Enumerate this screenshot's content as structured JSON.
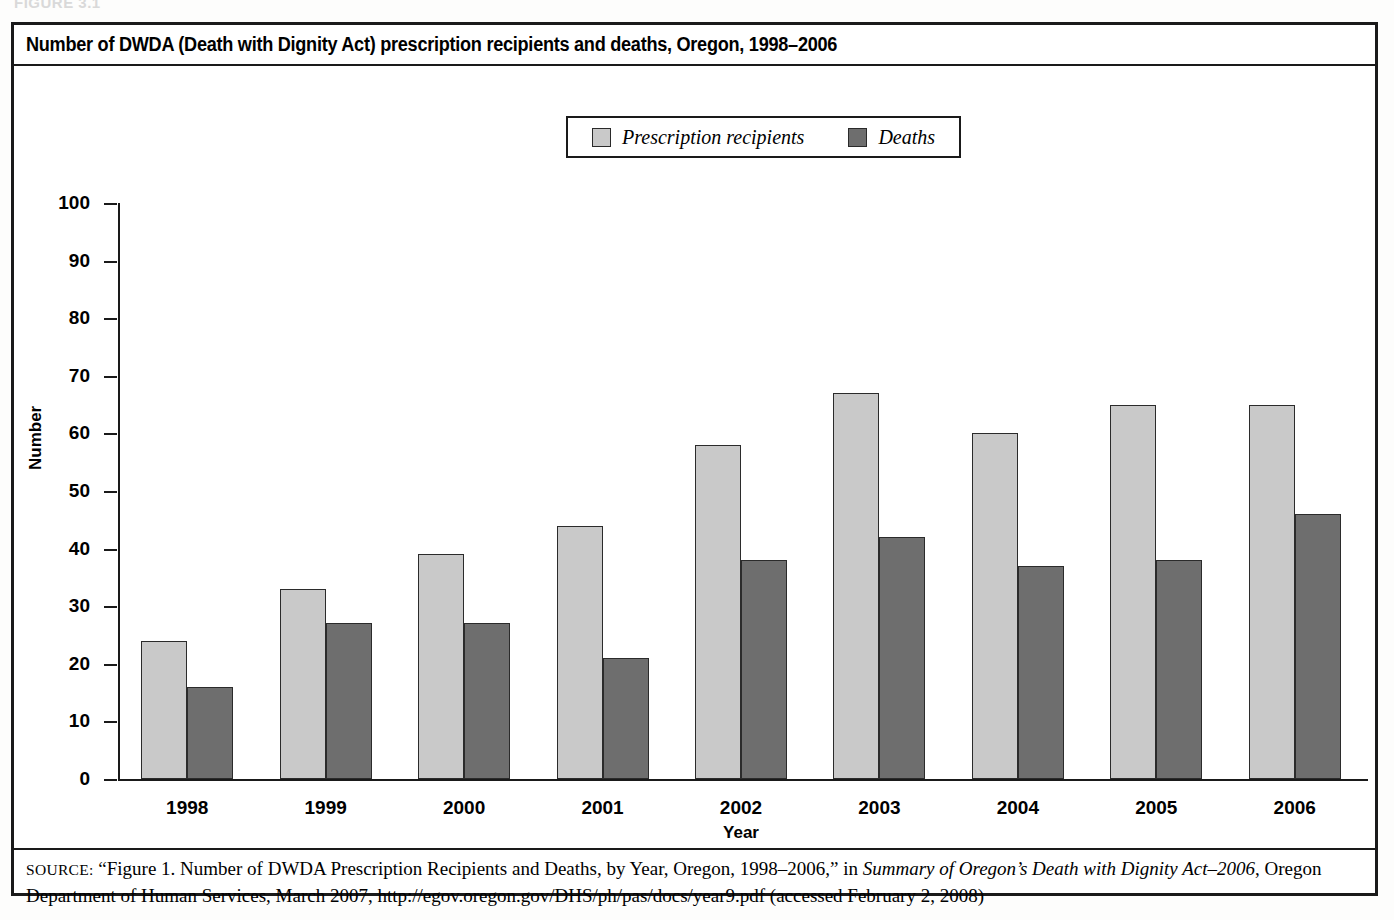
{
  "bleed_text": "FIGURE 3.1",
  "figure": {
    "title": "Number of DWDA (Death with Dignity Act) prescription recipients and deaths, Oregon, 1998–2006",
    "source_label": "SOURCE:",
    "source_part1": " “Figure 1. Number of DWDA Prescription Recipients and Deaths, by Year, Oregon, 1998–2006,” in ",
    "source_italic1": "Summary of Oregon’s Death with Dignity Act–2006",
    "source_part2": ", Oregon Department of Human Services, March 2007, http://egov.oregon.gov/DHS/ph/pas/docs/year9.pdf (accessed February 2, 2008)"
  },
  "legend": {
    "items": [
      {
        "label": "Prescription recipients",
        "color": "#c9c9c9"
      },
      {
        "label": "Deaths",
        "color": "#6e6e6e"
      }
    ]
  },
  "axes": {
    "y_ticks": [
      "100",
      "90",
      "80",
      "70",
      "60",
      "50",
      "40",
      "30",
      "20",
      "10",
      "0"
    ],
    "y_title": "Number",
    "x_title": "Year"
  },
  "chart_data": {
    "type": "bar",
    "title": "Number of DWDA (Death with Dignity Act) prescription recipients and deaths, Oregon, 1998–2006",
    "xlabel": "Year",
    "ylabel": "Number",
    "ylim": [
      0,
      100
    ],
    "ytick_step": 10,
    "grid": false,
    "legend_position": "top-center",
    "categories": [
      "1998",
      "1999",
      "2000",
      "2001",
      "2002",
      "2003",
      "2004",
      "2005",
      "2006"
    ],
    "series": [
      {
        "name": "Prescription recipients",
        "color": "#c9c9c9",
        "values": [
          24,
          33,
          39,
          44,
          58,
          67,
          60,
          65,
          65
        ]
      },
      {
        "name": "Deaths",
        "color": "#6e6e6e",
        "values": [
          16,
          27,
          27,
          21,
          38,
          42,
          37,
          38,
          46
        ]
      }
    ]
  }
}
